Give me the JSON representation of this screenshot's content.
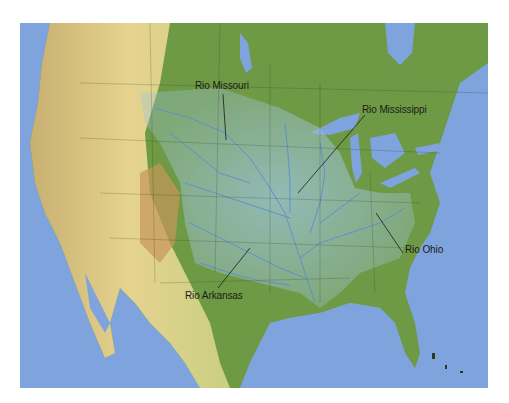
{
  "map": {
    "region": "North America (United States)",
    "subject": "Mississippi River basin",
    "colors": {
      "ocean": "#7fa3dc",
      "lowland": "#6f9a45",
      "plains": "#c9cf82",
      "highland": "#d9b77a",
      "basin_overlay": "#8fb8d8",
      "rivers": "#5b8fd0",
      "lakes": "#7fa3dc",
      "leader_lines": "#1a1a1a"
    },
    "labels": [
      {
        "text": "Rio Missouri",
        "x": 195,
        "y": 80
      },
      {
        "text": "Rio Mississippi",
        "x": 362,
        "y": 104
      },
      {
        "text": "Rio Ohio",
        "x": 405,
        "y": 244
      },
      {
        "text": "Rio Arkansas",
        "x": 185,
        "y": 290
      }
    ]
  }
}
